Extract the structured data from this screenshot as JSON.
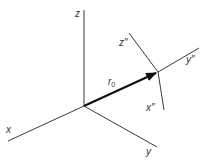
{
  "diagram": {
    "type": "3d-coordinate-frames",
    "colors": {
      "line": "#3a3a3a",
      "vector": "#111111",
      "label": "#333333"
    },
    "origin": {
      "x": 84,
      "y": 106
    },
    "frame_origin_primary": {
      "axes": [
        {
          "name": "z",
          "label": "z",
          "end": {
            "x": 84,
            "y": 10
          }
        },
        {
          "name": "x",
          "label": "x",
          "end": {
            "x": 8,
            "y": 141
          }
        },
        {
          "name": "y",
          "label": "y",
          "end": {
            "x": 157,
            "y": 147
          }
        }
      ]
    },
    "vector": {
      "label_main": "r",
      "label_sub": "0",
      "start": {
        "x": 84,
        "y": 106
      },
      "end": {
        "x": 158,
        "y": 72
      }
    },
    "frame_secondary": {
      "origin": {
        "x": 158,
        "y": 72
      },
      "axes": [
        {
          "name": "z2",
          "label": "z″",
          "end": {
            "x": 129,
            "y": 33
          }
        },
        {
          "name": "y2",
          "label": "y″",
          "end": {
            "x": 199,
            "y": 48
          }
        },
        {
          "name": "x2",
          "label": "x″",
          "end": {
            "x": 164,
            "y": 110
          }
        }
      ]
    }
  }
}
